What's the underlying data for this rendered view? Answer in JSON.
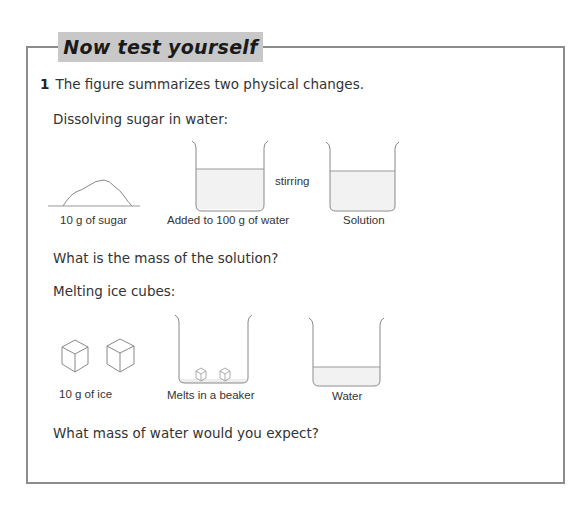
{
  "header": {
    "title": "Now test yourself"
  },
  "question": {
    "number": "1",
    "text": "The figure summarizes two physical changes."
  },
  "part_a": {
    "heading": "Dissolving sugar in water:",
    "labels": {
      "sugar": "10 g of sugar",
      "water": "Added to 100 g of water",
      "action": "stirring",
      "result": "Solution"
    },
    "question": "What is the mass of the solution?"
  },
  "part_b": {
    "heading": "Melting ice cubes:",
    "labels": {
      "ice": "10 g of ice",
      "beaker": "Melts in a beaker",
      "result": "Water"
    },
    "question": "What mass of water would you expect?"
  },
  "colors": {
    "frame": "#8c8c8c",
    "title_bg": "#c8c8c8",
    "liquid": "#f0f0f0",
    "line": "#888888"
  }
}
